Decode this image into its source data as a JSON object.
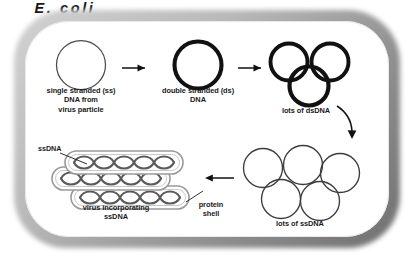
{
  "diagram": {
    "organism_label": "E. coli",
    "colors": {
      "cell_wall_gray": "#8e8e8e",
      "cell_interior": "#ffffff",
      "dsdna_stroke": "#111111",
      "ssdna_stroke": "#3c3c3c",
      "capsid_stroke": "#8a8a8a",
      "dna_coil_stroke": "#555555",
      "arrow": "#111111",
      "text": "#1a1a1a"
    },
    "labels": {
      "single_stranded": "single stranded (ss)\nDNA from\nvirus particle",
      "double_stranded": "double stranded (ds)\nDNA",
      "lots_of_dsdna": "lots of dsDNA",
      "ssdna_callout": "ssDNA",
      "virus_incorporating": "virus incorporating\nssDNA",
      "protein_shell": "protein\nshell",
      "lots_of_ssdna": "lots of ssDNA"
    },
    "steps": [
      {
        "id": "step-1",
        "label": "single stranded (ss)\nDNA from\nvirus particle",
        "glyph": "thin-circle",
        "count": 1
      },
      {
        "id": "step-2",
        "label": "double stranded (ds)\nDNA",
        "glyph": "thick-circle",
        "count": 1
      },
      {
        "id": "step-3",
        "label": "lots of dsDNA",
        "glyph": "thick-circle",
        "count": 3
      },
      {
        "id": "step-4",
        "label": "lots of ssDNA",
        "glyph": "thin-circle",
        "count": 5
      },
      {
        "id": "step-5",
        "label": "virus incorporating\nssDNA",
        "glyph": "capsid-with-coiled-dna",
        "count": 3
      }
    ],
    "arrows": [
      {
        "id": "arrow-1",
        "from": "step-1",
        "to": "step-2",
        "direction": "right"
      },
      {
        "id": "arrow-2",
        "from": "step-2",
        "to": "step-3",
        "direction": "right"
      },
      {
        "id": "arrow-3",
        "from": "step-3",
        "to": "step-4",
        "direction": "curve-down"
      },
      {
        "id": "arrow-4",
        "from": "step-4",
        "to": "step-5",
        "direction": "left"
      }
    ],
    "callouts": [
      {
        "id": "callout-ssdna",
        "label": "ssDNA",
        "points_to": "dna-coil"
      },
      {
        "id": "callout-protein-shell",
        "label": "protein\nshell",
        "points_to": "capsid-outline"
      }
    ]
  }
}
